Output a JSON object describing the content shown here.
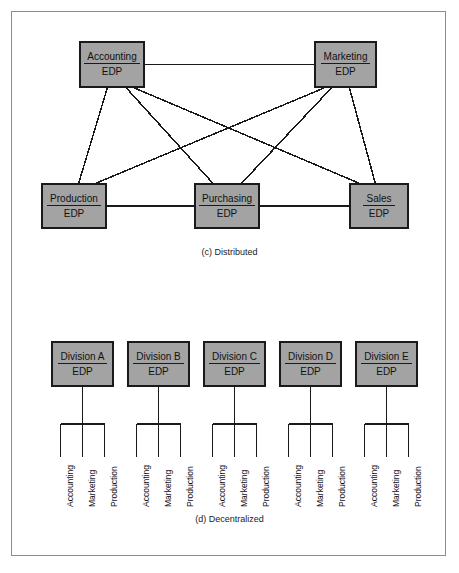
{
  "figure": {
    "width": 459,
    "height": 573,
    "background": "#ffffff",
    "frame_color": "#8c8c8c",
    "box_fill": "#a3a3a3",
    "box_border": "#1a1a1a",
    "line_color": "#1a1a1a",
    "text_color": "#111111"
  },
  "panels": [
    {
      "id": "panel-c",
      "caption": "(c) Distributed",
      "type": "distributed-network",
      "top_nodes": [
        {
          "name": "Accounting",
          "sub": "EDP",
          "x": 79,
          "y": 41,
          "w": 66,
          "h": 47
        },
        {
          "name": "Marketing",
          "sub": "EDP",
          "x": 314,
          "y": 41,
          "w": 63,
          "h": 47
        }
      ],
      "bottom_nodes": [
        {
          "name": "Production",
          "sub": "EDP",
          "x": 41,
          "y": 183,
          "w": 66,
          "h": 46
        },
        {
          "name": "Purchasing",
          "sub": "EDP",
          "x": 194,
          "y": 183,
          "w": 66,
          "h": 46
        },
        {
          "name": "Sales",
          "sub": "EDP",
          "x": 349,
          "y": 183,
          "w": 60,
          "h": 46
        }
      ],
      "edges": [
        {
          "from": "Accounting",
          "to": "Marketing"
        },
        {
          "from": "Accounting",
          "to": "Production"
        },
        {
          "from": "Accounting",
          "to": "Purchasing"
        },
        {
          "from": "Accounting",
          "to": "Sales"
        },
        {
          "from": "Marketing",
          "to": "Production"
        },
        {
          "from": "Marketing",
          "to": "Purchasing"
        },
        {
          "from": "Marketing",
          "to": "Sales"
        },
        {
          "from": "Production",
          "to": "Purchasing"
        },
        {
          "from": "Purchasing",
          "to": "Sales"
        }
      ]
    },
    {
      "id": "panel-d",
      "caption": "(d) Decentralized",
      "type": "decentralized-tree",
      "divisions": [
        {
          "name": "Division A",
          "sub": "EDP",
          "x": 51,
          "y": 341,
          "w": 63,
          "h": 46,
          "children": [
            "Accounting",
            "Marketing",
            "Production"
          ]
        },
        {
          "name": "Division B",
          "sub": "EDP",
          "x": 127,
          "y": 341,
          "w": 63,
          "h": 46,
          "children": [
            "Accounting",
            "Marketing",
            "Production"
          ]
        },
        {
          "name": "Division C",
          "sub": "EDP",
          "x": 203,
          "y": 341,
          "w": 63,
          "h": 46,
          "children": [
            "Accounting",
            "Marketing",
            "Production"
          ]
        },
        {
          "name": "Division D",
          "sub": "EDP",
          "x": 279,
          "y": 341,
          "w": 63,
          "h": 46,
          "children": [
            "Accounting",
            "Marketing",
            "Production"
          ]
        },
        {
          "name": "Division E",
          "sub": "EDP",
          "x": 355,
          "y": 341,
          "w": 63,
          "h": 46,
          "children": [
            "Accounting",
            "Marketing",
            "Production"
          ]
        }
      ]
    }
  ],
  "captions": {
    "c": "(c) Distributed",
    "d": "(d) Decentralized"
  }
}
